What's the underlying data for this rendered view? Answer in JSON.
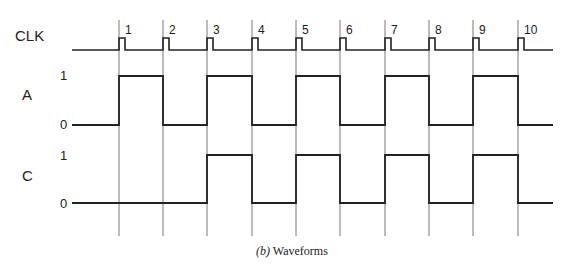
{
  "caption": {
    "prefix": "(b)",
    "text": " Waveforms"
  },
  "signals": {
    "clk": {
      "label": "CLK"
    },
    "a": {
      "label": "A",
      "high": "1",
      "low": "0"
    },
    "c": {
      "label": "C",
      "high": "1",
      "low": "0"
    }
  },
  "clock_edges": [
    {
      "n": "1",
      "x": 119
    },
    {
      "n": "2",
      "x": 163
    },
    {
      "n": "3",
      "x": 207
    },
    {
      "n": "4",
      "x": 252
    },
    {
      "n": "5",
      "x": 296
    },
    {
      "n": "6",
      "x": 340
    },
    {
      "n": "7",
      "x": 385
    },
    {
      "n": "8",
      "x": 429
    },
    {
      "n": "9",
      "x": 473
    },
    {
      "n": "10",
      "x": 518
    }
  ],
  "waveforms": {
    "A": [
      0,
      1,
      0,
      1,
      0,
      1,
      0,
      1,
      0,
      1,
      0
    ],
    "C": [
      0,
      0,
      0,
      1,
      0,
      1,
      0,
      1,
      0,
      1,
      0
    ]
  },
  "colors": {
    "line": "#222222",
    "grid": "#555555",
    "background": "#ffffff"
  }
}
